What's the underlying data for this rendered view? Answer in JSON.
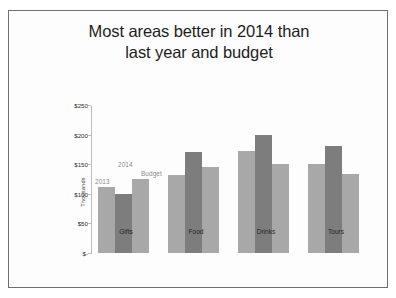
{
  "slide": {
    "title_line1": "Most areas better in 2014 than",
    "title_line2": "last year and budget"
  },
  "chart_data": {
    "type": "bar",
    "title": "Most areas better in 2014 than last year and budget",
    "xlabel": "",
    "ylabel": "Thousands",
    "categories": [
      "Gifts",
      "Food",
      "Drinks",
      "Tours"
    ],
    "series": [
      {
        "name": "2013",
        "values": [
          112,
          131,
          173,
          150
        ],
        "color": "#a8a8a8"
      },
      {
        "name": "2014",
        "values": [
          99,
          171,
          200,
          181
        ],
        "color": "#7d7d7d"
      },
      {
        "name": "Budget",
        "values": [
          125,
          145,
          150,
          133
        ],
        "color": "#a8a8a8"
      }
    ],
    "ylim": [
      0,
      250
    ],
    "ytick_values": [
      250,
      200,
      150,
      100,
      50,
      0
    ],
    "ytick_labels": [
      "$250",
      "$200",
      "$150",
      "$100",
      "$50",
      "$-"
    ],
    "grid": false,
    "legend": "in-chart data labels",
    "annotations": [
      {
        "text": "2013",
        "series": "2013"
      },
      {
        "text": "2014",
        "series": "2014"
      },
      {
        "text": "Budget",
        "series": "Budget"
      }
    ],
    "units": "Thousands"
  }
}
